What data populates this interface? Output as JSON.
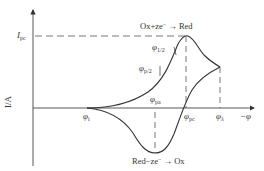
{
  "diagram": {
    "type": "cyclic-voltammogram",
    "axes": {
      "y_label": "I/A",
      "x_label": "−φ"
    },
    "labels": {
      "ipc": {
        "main": "I",
        "sub": "pc"
      },
      "phi_half": {
        "main": "φ",
        "sub": "1/2"
      },
      "phi_p2": {
        "main": "φ",
        "sub": "p/2"
      },
      "phi_pa": {
        "main": "φ",
        "sub": "pa"
      },
      "phi_pc": {
        "main": "φ",
        "sub": "pc"
      },
      "phi_i": {
        "main": "φ",
        "sub": "i"
      },
      "phi_lambda": {
        "main": "φ",
        "sub": "λ"
      }
    },
    "reactions": {
      "reduction": {
        "left": "Ox+ze",
        "sup": "−",
        "arrow": "→",
        "right": "Red"
      },
      "oxidation": {
        "left": "Red−ze",
        "sup": "−",
        "arrow": "→",
        "right": "Ox"
      }
    },
    "colors": {
      "line": "#333333",
      "dash": "#555555",
      "background": "#ffffff"
    }
  }
}
